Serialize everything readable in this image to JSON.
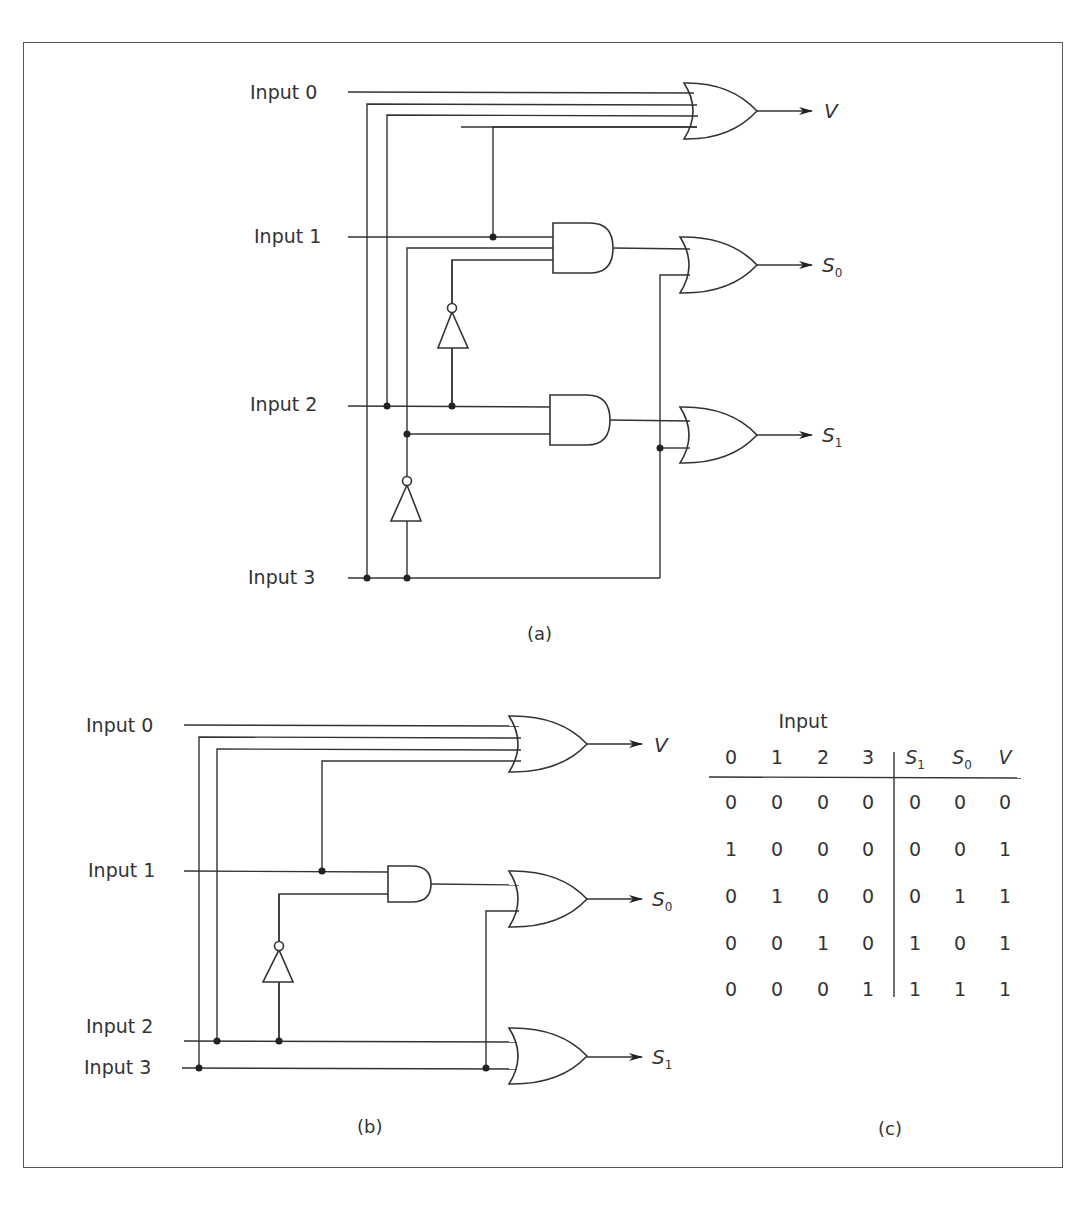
{
  "figure": {
    "parts": {
      "a": {
        "caption": "(a)",
        "inputs": [
          "Input 0",
          "Input 1",
          "Input 2",
          "Input 3"
        ],
        "outputs": [
          {
            "name": "V",
            "sub": ""
          },
          {
            "name": "S",
            "sub": "0"
          },
          {
            "name": "S",
            "sub": "1"
          }
        ]
      },
      "b": {
        "caption": "(b)",
        "inputs": [
          "Input 0",
          "Input 1",
          "Input 2",
          "Input 3"
        ],
        "outputs": [
          {
            "name": "V",
            "sub": ""
          },
          {
            "name": "S",
            "sub": "0"
          },
          {
            "name": "S",
            "sub": "1"
          }
        ]
      },
      "c": {
        "caption": "(c)",
        "group_header": "Input",
        "columns": [
          "0",
          "1",
          "2",
          "3",
          "S1",
          "S0",
          "V"
        ],
        "column_display": [
          {
            "name": "0",
            "sub": ""
          },
          {
            "name": "1",
            "sub": ""
          },
          {
            "name": "2",
            "sub": ""
          },
          {
            "name": "3",
            "sub": ""
          },
          {
            "name": "S",
            "sub": "1"
          },
          {
            "name": "S",
            "sub": "0"
          },
          {
            "name": "V",
            "sub": ""
          }
        ],
        "rows": [
          [
            "0",
            "0",
            "0",
            "0",
            "0",
            "0",
            "0"
          ],
          [
            "1",
            "0",
            "0",
            "0",
            "0",
            "0",
            "1"
          ],
          [
            "0",
            "1",
            "0",
            "0",
            "0",
            "1",
            "1"
          ],
          [
            "0",
            "0",
            "1",
            "0",
            "1",
            "0",
            "1"
          ],
          [
            "0",
            "0",
            "0",
            "1",
            "1",
            "1",
            "1"
          ]
        ]
      }
    }
  }
}
